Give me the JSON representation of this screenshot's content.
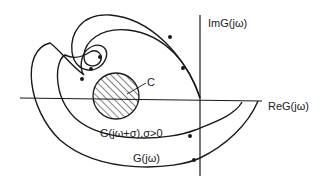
{
  "diagram": {
    "type": "nyquist-plot",
    "axes": {
      "imaginary_label": "ImG(jω)",
      "real_label": "ReG(jω)"
    },
    "region": {
      "label": "C",
      "fill": "hatched"
    },
    "curves": [
      {
        "id": "shifted",
        "label": "G(jω+σ),σ>0"
      },
      {
        "id": "original",
        "label": "G(jω)"
      }
    ],
    "colors": {
      "ink": "#1a1a1a",
      "background": "#ffffff"
    }
  }
}
